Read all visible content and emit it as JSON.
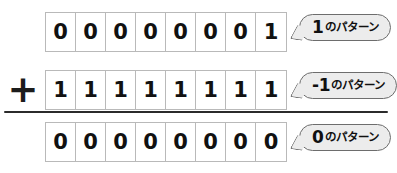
{
  "diagram": {
    "operator": "+",
    "colors": {
      "page_background": "#ffffff",
      "cell_background": "#ffffff",
      "cell_border": "#b9b9b9",
      "digit": "#111111",
      "callout_fill": "#ececec",
      "callout_border": "#6d6d6d",
      "rule": "#2b2b2b"
    },
    "rows": [
      {
        "id": "addend-1",
        "bits": [
          "0",
          "0",
          "0",
          "0",
          "0",
          "0",
          "0",
          "1"
        ],
        "callout": {
          "value": "1",
          "suffix": "のパターン",
          "full_text": "1のパターン"
        }
      },
      {
        "id": "addend-2",
        "operator": "+",
        "bits": [
          "1",
          "1",
          "1",
          "1",
          "1",
          "1",
          "1",
          "1"
        ],
        "callout": {
          "value": "-1",
          "suffix": "のパターン",
          "full_text": "-1のパターン"
        }
      },
      {
        "id": "sum",
        "bits": [
          "0",
          "0",
          "0",
          "0",
          "0",
          "0",
          "0",
          "0"
        ],
        "callout": {
          "value": "0",
          "suffix": "のパターン",
          "full_text": "0のパターン"
        }
      }
    ]
  }
}
